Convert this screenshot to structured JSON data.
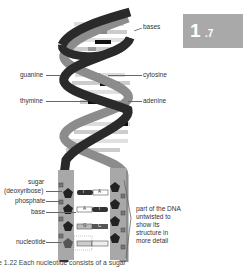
{
  "badge": {
    "number": "1",
    "sub": ".7"
  },
  "labels": {
    "bases": "bases",
    "guanine": "guanine",
    "cytosine": "cytosine",
    "thymine": "thymine",
    "adenine": "adenine",
    "sugar": "sugar",
    "deoxyribose": "(deoxyribose)",
    "phosphate": "phosphate",
    "base": "base",
    "nucleotide": "nucleotide",
    "untwisted": [
      "part of the DNA",
      "untwisted to",
      "show its",
      "structure in",
      "more detail"
    ]
  },
  "base_letters": [
    "T",
    "A",
    "A",
    "T",
    "G",
    "C"
  ],
  "caption": "ure 1.22 Each nucleotide consists of a sugar",
  "colors": {
    "badge": "#a9a9a9",
    "strand_dark": "#2a2a2a",
    "strand_grey": "#9a9a9a",
    "background": "#ffffff"
  }
}
